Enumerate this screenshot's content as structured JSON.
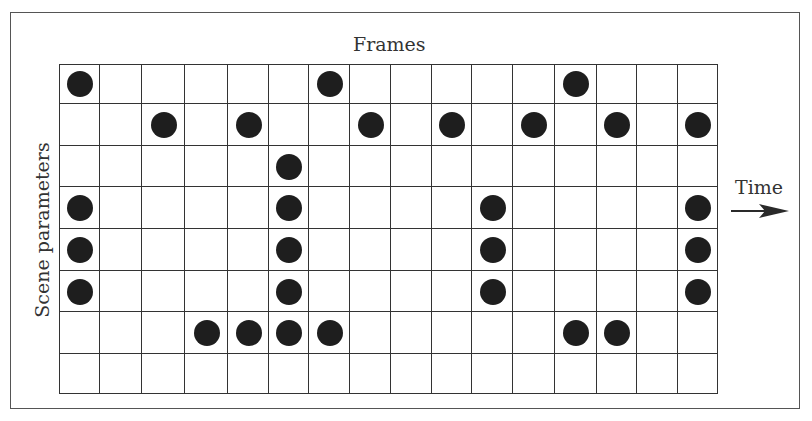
{
  "figure": {
    "title": "Frames",
    "y_axis_label": "Scene parameters",
    "time_label": "Time",
    "arrow_icon": "right-arrow-icon",
    "colors": {
      "dot": "#1e1e1e",
      "grid_line": "#333333",
      "border": "#555555",
      "background": "#ffffff"
    }
  },
  "grid": {
    "columns": 16,
    "rows": 8,
    "column_edges_px": [
      0,
      41,
      83,
      126,
      169,
      210,
      250,
      291,
      332,
      373,
      413,
      454,
      496,
      538,
      578,
      619,
      659
    ],
    "row_edges_px": [
      0,
      40,
      82,
      123,
      165,
      207,
      248,
      290,
      330
    ],
    "filled_cells": [
      {
        "row": 0,
        "col": 0
      },
      {
        "row": 0,
        "col": 6
      },
      {
        "row": 0,
        "col": 12
      },
      {
        "row": 1,
        "col": 2
      },
      {
        "row": 1,
        "col": 4
      },
      {
        "row": 1,
        "col": 7
      },
      {
        "row": 1,
        "col": 9
      },
      {
        "row": 1,
        "col": 11
      },
      {
        "row": 1,
        "col": 13
      },
      {
        "row": 1,
        "col": 15
      },
      {
        "row": 2,
        "col": 5
      },
      {
        "row": 3,
        "col": 0
      },
      {
        "row": 3,
        "col": 5
      },
      {
        "row": 3,
        "col": 10
      },
      {
        "row": 3,
        "col": 15
      },
      {
        "row": 4,
        "col": 0
      },
      {
        "row": 4,
        "col": 5
      },
      {
        "row": 4,
        "col": 10
      },
      {
        "row": 4,
        "col": 15
      },
      {
        "row": 5,
        "col": 0
      },
      {
        "row": 5,
        "col": 5
      },
      {
        "row": 5,
        "col": 10
      },
      {
        "row": 5,
        "col": 15
      },
      {
        "row": 6,
        "col": 3
      },
      {
        "row": 6,
        "col": 4
      },
      {
        "row": 6,
        "col": 5
      },
      {
        "row": 6,
        "col": 6
      },
      {
        "row": 6,
        "col": 12
      },
      {
        "row": 6,
        "col": 13
      }
    ]
  }
}
